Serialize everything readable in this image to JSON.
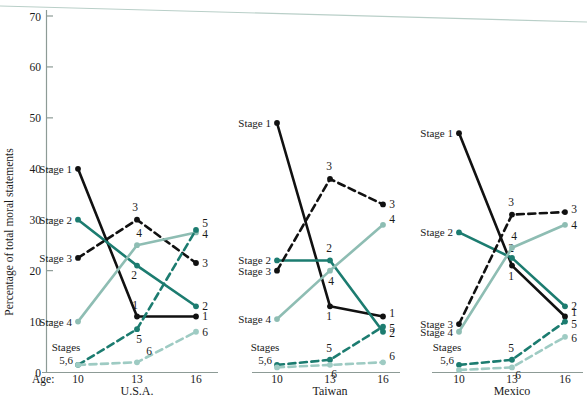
{
  "figure": {
    "y_axis_title": "Percentage of total moral statements",
    "age_prefix": "Age:",
    "y_ticks": [
      0,
      10,
      20,
      30,
      40,
      50,
      60,
      70
    ],
    "x_ticks": [
      10,
      13,
      16
    ],
    "ylim": [
      0,
      72
    ],
    "stage_label_prefix": "Stage",
    "stages_56_label_line1": "Stages",
    "stages_56_label_line2": "5,6"
  },
  "colors": {
    "stage1": "#111111",
    "stage2": "#1c7c70",
    "stage3": "#111111",
    "stage4": "#8ebdb3",
    "stage5": "#1c7c70",
    "stage6": "#9ecbc3",
    "axis": "#8d9b96",
    "scan_artifact": "#b9cfc8",
    "background": "#ffffff"
  },
  "chart_data": {
    "type": "line",
    "title": "",
    "xlabel": "Age:",
    "ylabel": "Percentage of total moral statements",
    "ylim": [
      0,
      72
    ],
    "grid": false,
    "legend": "inline-labels",
    "x": [
      10,
      13,
      16
    ],
    "panels": [
      {
        "name": "U.S.A.",
        "left_labels": [
          {
            "text": "Stage 1",
            "value": 40
          },
          {
            "text": "Stage 2",
            "value": 30
          },
          {
            "text": "Stage 3",
            "value": 22.5
          },
          {
            "text": "Stage 4",
            "value": 10
          },
          {
            "text": "Stages 5,6",
            "value": 1.5
          }
        ],
        "series": [
          {
            "name": "Stage 1",
            "style": "solid",
            "color_key": "stage1",
            "values": [
              40,
              11,
              11
            ],
            "annotations": [
              {
                "at": 13,
                "text": "1",
                "dx": -2,
                "dy": -7
              },
              {
                "at": 16,
                "text": "1",
                "dx": 9,
                "dy": 4
              }
            ]
          },
          {
            "name": "Stage 2",
            "style": "solid",
            "color_key": "stage2",
            "values": [
              30,
              21,
              13
            ],
            "annotations": [
              {
                "at": 13,
                "text": "2",
                "dx": -3,
                "dy": 13
              },
              {
                "at": 16,
                "text": "2",
                "dx": 9,
                "dy": 4
              }
            ]
          },
          {
            "name": "Stage 3",
            "style": "dashed",
            "color_key": "stage3",
            "values": [
              22.5,
              30,
              21.5
            ],
            "annotations": [
              {
                "at": 13,
                "text": "3",
                "dx": -2,
                "dy": -9
              },
              {
                "at": 16,
                "text": "3",
                "dx": 9,
                "dy": 4
              }
            ]
          },
          {
            "name": "Stage 4",
            "style": "solid",
            "color_key": "stage4",
            "values": [
              10,
              25,
              27.5
            ],
            "annotations": [
              {
                "at": 13,
                "text": "4",
                "dx": 2,
                "dy": -8
              },
              {
                "at": 16,
                "text": "4",
                "dx": 9,
                "dy": 6
              }
            ]
          },
          {
            "name": "Stage 5",
            "style": "dashed",
            "color_key": "stage5",
            "values": [
              1.5,
              8.5,
              28
            ],
            "annotations": [
              {
                "at": 13,
                "text": "5",
                "dx": 2,
                "dy": 14
              },
              {
                "at": 16,
                "text": "5",
                "dx": 9,
                "dy": -3
              }
            ]
          },
          {
            "name": "Stage 6",
            "style": "dashed",
            "color_key": "stage6",
            "values": [
              1.5,
              2,
              8
            ],
            "annotations": [
              {
                "at": 13,
                "text": "6",
                "dx": 12,
                "dy": -7
              },
              {
                "at": 16,
                "text": "6",
                "dx": 9,
                "dy": 4
              }
            ]
          }
        ]
      },
      {
        "name": "Taiwan",
        "left_labels": [
          {
            "text": "Stage 1",
            "value": 49
          },
          {
            "text": "Stage 2",
            "value": 22
          },
          {
            "text": "Stage 3",
            "value": 20
          },
          {
            "text": "Stage 4",
            "value": 10.5
          },
          {
            "text": "Stages 5,6",
            "value": 1.5
          }
        ],
        "series": [
          {
            "name": "Stage 1",
            "style": "solid",
            "color_key": "stage1",
            "values": [
              49,
              13,
              11
            ],
            "annotations": [
              {
                "at": 13,
                "text": "1",
                "dx": -1,
                "dy": 14
              },
              {
                "at": 16,
                "text": "1",
                "dx": 9,
                "dy": 1
              }
            ]
          },
          {
            "name": "Stage 2",
            "style": "solid",
            "color_key": "stage2",
            "values": [
              22,
              22,
              8
            ],
            "annotations": [
              {
                "at": 13,
                "text": "2",
                "dx": -1,
                "dy": -8
              },
              {
                "at": 16,
                "text": "2",
                "dx": 9,
                "dy": 5
              }
            ]
          },
          {
            "name": "Stage 3",
            "style": "dashed",
            "color_key": "stage3",
            "values": [
              20,
              38,
              33
            ],
            "annotations": [
              {
                "at": 13,
                "text": "3",
                "dx": -1,
                "dy": -9
              },
              {
                "at": 16,
                "text": "3",
                "dx": 9,
                "dy": 4
              }
            ]
          },
          {
            "name": "Stage 4",
            "style": "solid",
            "color_key": "stage4",
            "values": [
              10.5,
              20,
              29
            ],
            "annotations": [
              {
                "at": 13,
                "text": "4",
                "dx": 1,
                "dy": 14
              },
              {
                "at": 16,
                "text": "4",
                "dx": 9,
                "dy": -2
              }
            ]
          },
          {
            "name": "Stage 5",
            "style": "dashed",
            "color_key": "stage5",
            "values": [
              1.5,
              2.5,
              9
            ],
            "annotations": [
              {
                "at": 13,
                "text": "5",
                "dx": -1,
                "dy": -8
              },
              {
                "at": 16,
                "text": "5",
                "dx": 9,
                "dy": 5
              }
            ]
          },
          {
            "name": "Stage 6",
            "style": "dashed",
            "color_key": "stage6",
            "values": [
              1,
              1.5,
              2
            ],
            "annotations": [
              {
                "at": 13,
                "text": "6",
                "dx": 4,
                "dy": 13
              },
              {
                "at": 16,
                "text": "6",
                "dx": 9,
                "dy": -2
              }
            ]
          }
        ]
      },
      {
        "name": "Mexico",
        "left_labels": [
          {
            "text": "Stage 1",
            "value": 47
          },
          {
            "text": "Stage 2",
            "value": 27.5
          },
          {
            "text": "Stage 3",
            "value": 9.5
          },
          {
            "text": "Stage 4",
            "value": 8
          },
          {
            "text": "Stages 5,6",
            "value": 1.5
          }
        ],
        "series": [
          {
            "name": "Stage 1",
            "style": "solid",
            "color_key": "stage1",
            "values": [
              47,
              21,
              11
            ],
            "annotations": [
              {
                "at": 13,
                "text": "1",
                "dx": -1,
                "dy": 14
              },
              {
                "at": 16,
                "text": "1",
                "dx": 9,
                "dy": 0
              }
            ]
          },
          {
            "name": "Stage 2",
            "style": "solid",
            "color_key": "stage2",
            "values": [
              27.5,
              22.5,
              13
            ],
            "annotations": [
              {
                "at": 13,
                "text": "2",
                "dx": -1,
                "dy": -6
              },
              {
                "at": 16,
                "text": "2",
                "dx": 9,
                "dy": 4
              }
            ]
          },
          {
            "name": "Stage 3",
            "style": "dashed",
            "color_key": "stage3",
            "values": [
              9.5,
              31,
              31.5
            ],
            "annotations": [
              {
                "at": 13,
                "text": "3",
                "dx": -1,
                "dy": -9
              },
              {
                "at": 16,
                "text": "3",
                "dx": 9,
                "dy": 1
              }
            ]
          },
          {
            "name": "Stage 4",
            "style": "solid",
            "color_key": "stage4",
            "values": [
              8,
              24.5,
              29
            ],
            "annotations": [
              {
                "at": 13,
                "text": "4",
                "dx": 2,
                "dy": -8
              },
              {
                "at": 16,
                "text": "4",
                "dx": 9,
                "dy": 4
              }
            ]
          },
          {
            "name": "Stage 5",
            "style": "dashed",
            "color_key": "stage5",
            "values": [
              1.5,
              2.5,
              10
            ],
            "annotations": [
              {
                "at": 13,
                "text": "5",
                "dx": -1,
                "dy": -8
              },
              {
                "at": 16,
                "text": "5",
                "dx": 9,
                "dy": 6
              }
            ]
          },
          {
            "name": "Stage 6",
            "style": "dashed",
            "color_key": "stage6",
            "values": [
              0.5,
              1,
              7
            ],
            "annotations": [
              {
                "at": 13,
                "text": "6",
                "dx": 6,
                "dy": 12
              },
              {
                "at": 16,
                "text": "6",
                "dx": 9,
                "dy": 5
              }
            ]
          }
        ]
      }
    ]
  }
}
